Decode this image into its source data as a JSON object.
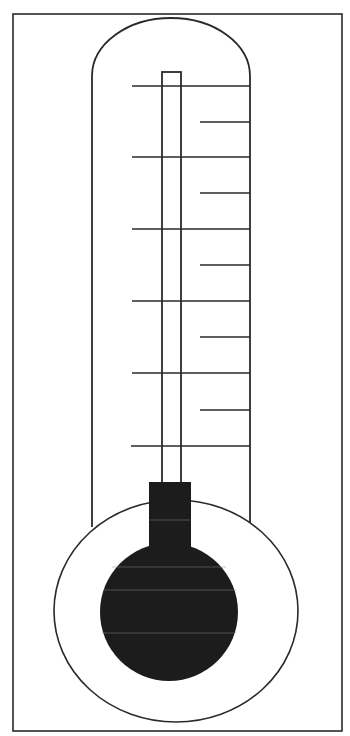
{
  "diagram": {
    "title": "",
    "type": "thermometer-template",
    "colors": {
      "stroke": "#2a2a2a",
      "fill": "#1c1c1c",
      "background": "#ffffff"
    },
    "scale": {
      "major_ticks": 6,
      "minor_ticks": 5,
      "labels": []
    },
    "fill_level": "bulb-only"
  }
}
